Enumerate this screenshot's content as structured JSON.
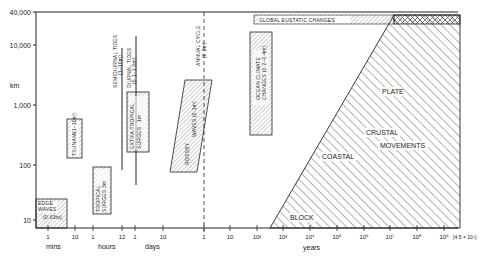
{
  "figure": {
    "y_axis": {
      "unit": "km",
      "ticks": [
        "40,000",
        "10,000",
        "1,000",
        "100",
        "10"
      ]
    },
    "x_axis": {
      "ticks": [
        {
          "label": "1",
          "group": "mins"
        },
        {
          "label": "10",
          "group": "mins"
        },
        {
          "label": "1",
          "group": "hours"
        },
        {
          "label": "12",
          "group": "hours"
        },
        {
          "label": "1",
          "group": "days"
        },
        {
          "label": "10",
          "group": "days"
        },
        {
          "label": "1",
          "group": "years"
        },
        {
          "label": "10",
          "group": "years"
        },
        {
          "label": "10²",
          "group": "years"
        },
        {
          "label": "10³",
          "group": "years"
        },
        {
          "label": "10⁴",
          "group": "years"
        },
        {
          "label": "10⁵",
          "group": "years"
        },
        {
          "label": "10⁶",
          "group": "years"
        },
        {
          "label": "10⁷",
          "group": "years"
        },
        {
          "label": "10⁸",
          "group": "years"
        },
        {
          "label": "10⁹",
          "group": "years"
        }
      ],
      "end_label": "[4·5 × 10⁹]",
      "unit_groups": [
        "mins",
        "hours",
        "days",
        "years"
      ]
    },
    "phenomena": {
      "edge_waves": {
        "line1": "EDGE",
        "line2": "WAVES",
        "amp": "(0·03m)"
      },
      "tsunami": {
        "name": "TSUNAMI",
        "amp": "(1–10m)"
      },
      "tropical_surges": {
        "line1": "TROPICAL",
        "line2": "SURGES",
        "amp": "3m"
      },
      "extra_tropical_surges": {
        "line1": "EXTRA-TROPICAL",
        "line2": "SURGES",
        "amp": "1m"
      },
      "semidiurnal_tides": {
        "name": "SEMIDIURNAL TIDES",
        "amp": "(1–10m)"
      },
      "diurnal_tides": {
        "name": "DIURNAL TIDES",
        "amp": "(0·1–1·0m)"
      },
      "rossby_waves": {
        "line1": "ROSSBY",
        "line2": "WAVES",
        "amp": "(0·1m)"
      },
      "annual_cycle": {
        "name": "ANNUAL CYCLE",
        "amp": "(0·2m)"
      },
      "ocean_climate": {
        "line1": "OCEAN CLIMATE",
        "line2": "CHANGES (0·2–0·4m)"
      },
      "global_eustatic": {
        "name": "GLOBAL EUSTATIC CHANGES"
      },
      "crustal": {
        "plate": "PLATE",
        "crustal": "CRUSTAL",
        "movements": "MOVEMENTS",
        "coastal": "COASTAL",
        "block": "BLOCK"
      }
    }
  }
}
